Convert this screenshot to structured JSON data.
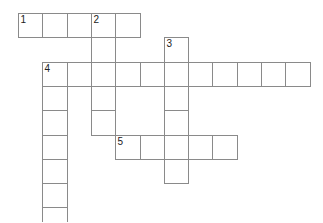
{
  "crossword": {
    "cell_size": 24.3,
    "origin": [
      18,
      13
    ],
    "entries": [
      {
        "number": "1",
        "direction": "across",
        "row": 0,
        "col": 0,
        "length": 5
      },
      {
        "number": "2",
        "direction": "down",
        "row": 0,
        "col": 3,
        "length": 5
      },
      {
        "number": "3",
        "direction": "down",
        "row": 1,
        "col": 6,
        "length": 6
      },
      {
        "number": "4",
        "direction": "across",
        "row": 2,
        "col": 1,
        "length": 11
      },
      {
        "number": "4",
        "direction": "down",
        "row": 2,
        "col": 1,
        "length": 7
      },
      {
        "number": "5",
        "direction": "across",
        "row": 5,
        "col": 4,
        "length": 5
      }
    ]
  }
}
